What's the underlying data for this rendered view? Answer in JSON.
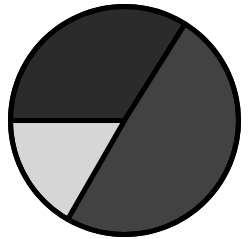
{
  "chart_data": {
    "type": "pie",
    "title": "",
    "labels": [
      "Slice A (dark)",
      "Slice B (medium)",
      "Slice C (light)"
    ],
    "values": [
      33.9,
      49.4,
      16.7
    ],
    "colors": [
      "#2b2b2b",
      "#424242",
      "#d6d6d6"
    ],
    "start_angle_deg": 180,
    "direction": "clockwise",
    "outline_color": "#000000",
    "legend": "none",
    "data_labels": "none"
  },
  "layout": {
    "cx": 124.5,
    "cy": 120.5,
    "r": 114,
    "stroke_width": 5,
    "background": "#ffffff"
  }
}
